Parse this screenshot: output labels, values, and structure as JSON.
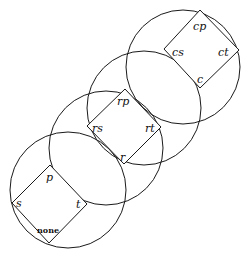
{
  "diagram": {
    "type": "lattice-of-circles",
    "circles": [
      {
        "id": "circle-1",
        "cx": 68,
        "cy": 190,
        "r": 58
      },
      {
        "id": "circle-2",
        "cx": 106,
        "cy": 148,
        "r": 57
      },
      {
        "id": "circle-3",
        "cx": 144,
        "cy": 108,
        "r": 57
      },
      {
        "id": "circle-4",
        "cx": 183,
        "cy": 67,
        "r": 57
      }
    ],
    "squares": [
      {
        "id": "square-bottom",
        "top": "p",
        "left": "s",
        "right": "t",
        "bottom": "none"
      },
      {
        "id": "square-middle",
        "top": "rp",
        "left": "rs",
        "right": "rt",
        "bottom": "r"
      },
      {
        "id": "square-top",
        "top": "cp",
        "left": "cs",
        "right": "ct",
        "bottom": "c"
      }
    ],
    "labels": {
      "p": "p",
      "s": "s",
      "t": "t",
      "none": "none",
      "rp": "rp",
      "rs": "rs",
      "rt": "rt",
      "r": "r",
      "cp": "cp",
      "cs": "cs",
      "ct": "ct",
      "c": "c"
    }
  }
}
